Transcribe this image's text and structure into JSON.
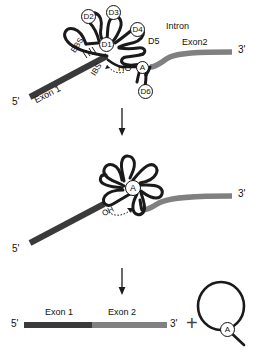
{
  "figure": {
    "colors": {
      "exon1": "#3a3a3a",
      "exon2": "#808080",
      "intron_stroke": "#1a1a1a",
      "text": "#111111",
      "arrow": "#1a1a1a",
      "plus": "#444444"
    }
  },
  "panel_top": {
    "name": "pre-mRNA-with-intron",
    "labels": {
      "exon1": "Exon 1",
      "exon2": "Exon2",
      "intron": "Intron",
      "five_prime": "5'",
      "three_prime": "3'",
      "ebs": "EBS",
      "ibs": "IBS",
      "branch_site": "HO-A",
      "branch_ho": "HO",
      "branch_dash": "-",
      "branch_a": "A"
    },
    "domains": [
      {
        "id": "D1",
        "label": "D1"
      },
      {
        "id": "D2",
        "label": "D2"
      },
      {
        "id": "D3",
        "label": "D3"
      },
      {
        "id": "D4",
        "label": "D4"
      },
      {
        "id": "D5",
        "label": "D5"
      },
      {
        "id": "D6",
        "label": "D6"
      }
    ]
  },
  "panel_middle": {
    "name": "lariat-intermediate",
    "labels": {
      "hydroxyl": "OH",
      "branch_a": "A",
      "three_prime": "3'",
      "five_prime": "5'"
    }
  },
  "panel_bottom": {
    "name": "spliced-products",
    "labels": {
      "exon1": "Exon 1",
      "exon2": "Exon 2",
      "five_prime": "5'",
      "three_prime": "3'",
      "plus": "+",
      "branch_a": "A"
    }
  },
  "arrows": {
    "step1": "down-arrow-step-1",
    "step2": "down-arrow-step-2"
  }
}
